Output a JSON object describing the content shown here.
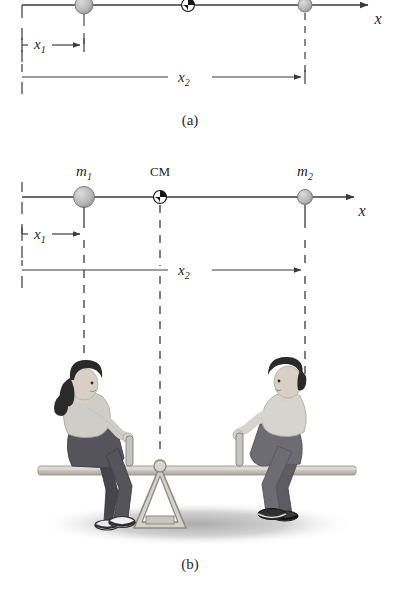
{
  "figure": {
    "type": "physics-diagram",
    "panels": [
      {
        "id": "a",
        "caption": "(a)",
        "axis_label": "x",
        "elements": {
          "mass1_label": "",
          "mass2_label": "",
          "cm_label": "",
          "dim1_label": "x₁",
          "dim2_label": "x₂"
        }
      },
      {
        "id": "b",
        "caption": "(b)",
        "axis_label": "x",
        "elements": {
          "mass1_label": "m₁",
          "mass2_label": "m₂",
          "cm_label": "CM",
          "dim1_label": "x₁",
          "dim2_label": "x₂"
        }
      }
    ]
  },
  "labels": {
    "m1_base": "m",
    "m1_sub": "1",
    "m2_base": "m",
    "m2_sub": "2",
    "cm": "CM",
    "x_axis": "x",
    "x1_base": "x",
    "x1_sub": "1",
    "x2_base": "x",
    "x2_sub": "2",
    "caption_a": "(a)",
    "caption_b": "(b)"
  },
  "colors": {
    "line": "#3a3a3a",
    "mass_fill": "#b9b9b9",
    "mass_stroke": "#6e6e6e",
    "cm_dark": "#151515",
    "cm_light": "#ffffff",
    "plank": "#c8c6c0",
    "plank_edge": "#9a968e",
    "fulcrum": "#cfcdc8",
    "fulcrum_edge": "#8e8a84",
    "shadow": "#b5b5b5",
    "hair": "#2a2a2a",
    "skin": "#d8cfc6",
    "girl_top": "#cfcdc8",
    "girl_pants": "#55545a",
    "boy_top": "#d6d4cf",
    "boy_pants": "#6d6c72",
    "shoe_dark": "#2e2e2e",
    "shoe_light": "#efefef",
    "background": "#ffffff"
  },
  "geometry": {
    "panel_a": {
      "axis_y": 5,
      "axis_x_start": 22,
      "axis_x_end": 372,
      "m1_x": 84,
      "cm_x": 188,
      "m2_x": 305,
      "dim1_y": 44,
      "dim2_y": 77
    },
    "panel_b": {
      "axis_y": 197,
      "axis_x_start": 22,
      "axis_x_end": 358,
      "m1_x": 84,
      "cm_x": 160,
      "m2_x": 305,
      "dim1_y": 234,
      "dim2_y": 270,
      "plank_y": 470,
      "fulcrum_x": 160,
      "ground_y": 528
    }
  }
}
